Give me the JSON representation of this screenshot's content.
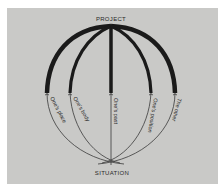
{
  "diagram": {
    "top_label": "PROJECT",
    "bottom_label": "SITUATION",
    "branches": [
      {
        "label": "One's place"
      },
      {
        "label": "One's body"
      },
      {
        "label": "One's past"
      },
      {
        "label": "One's position"
      },
      {
        "label": "The other"
      }
    ],
    "colors": {
      "background": "#c9c9c7",
      "ink": "#1a1a1a",
      "thin_line": "#3a3a3a"
    }
  }
}
